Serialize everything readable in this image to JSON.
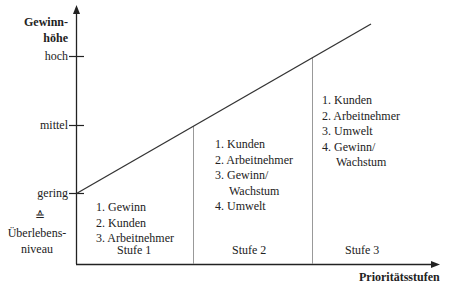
{
  "y_axis": {
    "title_line1": "Gewinn-",
    "title_line2": "höhe",
    "ticks": [
      {
        "label": "hoch"
      },
      {
        "label": "mittel"
      },
      {
        "label": "gering"
      }
    ],
    "equiv_symbol": "≙",
    "baseline_label_line1": "Überlebens-",
    "baseline_label_line2": "niveau"
  },
  "x_axis": {
    "title": "Prioritätsstufen"
  },
  "stages": [
    {
      "label": "Stufe 1",
      "priorities": [
        "1. Gewinn",
        "2. Kunden",
        "3. Arbeitnehmer"
      ]
    },
    {
      "label": "Stufe 2",
      "priorities": [
        "1. Kunden",
        "2. Arbeitnehmer",
        "3. Gewinn/",
        "Wachstum",
        "4. Umwelt"
      ]
    },
    {
      "label": "Stufe 3",
      "priorities": [
        "1. Kunden",
        "2. Arbeitnehmer",
        "3. Umwelt",
        "4. Gewinn/",
        "Wachstum"
      ]
    }
  ],
  "colors": {
    "axis": "#222222",
    "divider": "#999999",
    "line": "#333333"
  }
}
